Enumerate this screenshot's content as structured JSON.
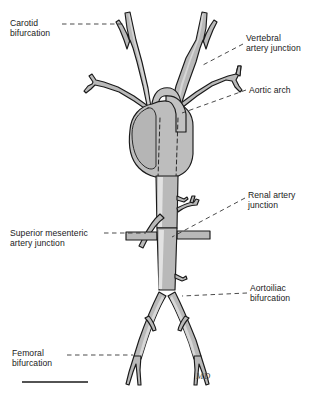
{
  "figure": {
    "background_color": "#ffffff",
    "width": 322,
    "height": 395
  },
  "artwork": {
    "vessel_fill": "#b9b9b9",
    "vessel_fill_light": "#d2d2d2",
    "vessel_highlight": "#e8e8e8",
    "heart_fill": "#bdbdbd",
    "outline_color": "#1a1a1a",
    "hidden_course_style": "dashed",
    "signature": "MD"
  },
  "labels": [
    {
      "id": "carotid-bifurcation",
      "text": "Carotid\nbifurcation",
      "side": "left",
      "x": 10,
      "y": 18
    },
    {
      "id": "vertebral-artery-junction",
      "text": "Vertebral\nartery junction",
      "side": "right",
      "x": 246,
      "y": 33
    },
    {
      "id": "aortic-arch",
      "text": "Aortic arch",
      "side": "right",
      "x": 249,
      "y": 85
    },
    {
      "id": "renal-artery-junction",
      "text": "Renal artery\njunction",
      "side": "right",
      "x": 248,
      "y": 190
    },
    {
      "id": "superior-mesenteric-artery-junction",
      "text": "Superior mesenteric\nartery junction",
      "side": "left",
      "x": 10,
      "y": 228
    },
    {
      "id": "aortoiliac-bifurcation",
      "text": "Aortoiliac\nbifurcation",
      "side": "right",
      "x": 250,
      "y": 283
    },
    {
      "id": "femoral-bifurcation",
      "text": "Femoral\nbifurcation",
      "side": "left",
      "x": 12,
      "y": 348
    }
  ],
  "scale_bar": {
    "present": true,
    "x1": 22,
    "x2": 88,
    "y": 382,
    "color": "#1a1a1a",
    "caption": ""
  },
  "anatomy_parts": [
    "left common carotid artery",
    "right common carotid artery",
    "carotid bifurcation",
    "vertebral artery",
    "subclavian artery",
    "aortic arch",
    "heart",
    "descending thoracic aorta",
    "abdominal aorta",
    "superior mesenteric artery",
    "renal arteries",
    "aortoiliac bifurcation",
    "common iliac artery",
    "internal iliac artery",
    "external iliac artery",
    "femoral bifurcation"
  ]
}
